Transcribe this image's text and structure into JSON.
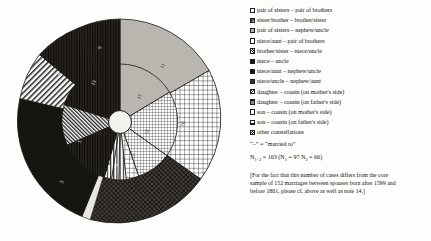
{
  "chart_data": {
    "type": "pie",
    "title": "",
    "subtitle": "",
    "xlabel": "",
    "ylabel": "",
    "legend_position": "right",
    "grid": false,
    "rings": 2,
    "center_hub": true,
    "categories": [
      "pair of sisters – pair of brothers",
      "sister/brother – brother/sister",
      "pair of sisters – nephew/uncle",
      "niece/aunt – pair of brothers",
      "brother/sister – niece/uncle",
      "niece – uncle",
      "niece/aunt – nephew/uncle",
      "niece/uncle – nephew/aunt",
      "daughter – cousin (on mother's side)",
      "daughter – cousin (on father's side)",
      "son – cousin (on mother's side)",
      "son – cousin (on father's side)",
      "other constellations"
    ],
    "outer_ring": {
      "name": "outer sectors",
      "segments": [
        {
          "label": "11",
          "value": 11,
          "pattern": "gray"
        },
        {
          "label": "16",
          "value": 16,
          "pattern": "grid-coarse"
        },
        {
          "label": "14",
          "value": 14,
          "pattern": "crosshatch-dark"
        },
        {
          "label": "5",
          "value": 5,
          "pattern": "black"
        },
        {
          "label": "7",
          "value": 7,
          "pattern": "diag-right"
        },
        {
          "label": "8",
          "value": 8,
          "pattern": "dense-dark"
        },
        {
          "label": "9",
          "value": 9,
          "pattern": "dense-dark"
        }
      ]
    },
    "inner_ring": {
      "name": "inner sectors",
      "segments": [
        {
          "label": "13",
          "value": 13,
          "pattern": "gray"
        },
        {
          "label": "12",
          "value": 12,
          "pattern": "grid-fine"
        },
        {
          "label": "10",
          "value": 10,
          "pattern": "grid-fine"
        },
        {
          "label": "6",
          "value": 6,
          "pattern": "grid-coarse"
        },
        {
          "label": "4",
          "value": 4,
          "pattern": "vert"
        },
        {
          "label": "3",
          "value": 3,
          "pattern": "vert"
        },
        {
          "label": "2",
          "value": 2,
          "pattern": "vert"
        },
        {
          "label": "1",
          "value": 1,
          "pattern": "diag-left-dense"
        },
        {
          "label": "15",
          "value": 15,
          "pattern": "dense-dark"
        }
      ]
    }
  },
  "legend": {
    "items": [
      {
        "pattern": "light-dots",
        "label": "pair of sisters – pair of brothers"
      },
      {
        "pattern": "grid-fine",
        "label": "sister/brother – brother/sister"
      },
      {
        "pattern": "gray",
        "label": "pair of sisters – nephew/uncle"
      },
      {
        "pattern": "grid-coarse",
        "label": "niece/aunt – pair of brothers"
      },
      {
        "pattern": "diag-right",
        "label": "brother/sister – niece/uncle"
      },
      {
        "pattern": "black",
        "label": "niece – uncle"
      },
      {
        "pattern": "dense-dark",
        "label": "niece/aunt – nephew/uncle"
      },
      {
        "pattern": "crosshatch-dark",
        "label": "niece/uncle – nephew/aunt"
      },
      {
        "pattern": "diag-left",
        "label": "daughter – cousin (on mother's side)"
      },
      {
        "pattern": "check",
        "label": "daughter – cousin (on father's side)"
      },
      {
        "pattern": "vert",
        "label": "son – cousin (on mother's side)"
      },
      {
        "pattern": "horiz",
        "label": "son – cousin (on father's side)"
      },
      {
        "pattern": "diag-left-dense",
        "label": "other constellations"
      }
    ]
  },
  "notes": {
    "married_key": "“–” = “married to”",
    "n_total_label": "N",
    "n_total_sub": "1+2",
    "n_total_value": "163",
    "n1_label": "N",
    "n1_sub": "1",
    "n1_value": "97",
    "n2_label": "N",
    "n2_sub": "2",
    "n2_value": "66",
    "footnote": "[For the fact that this number of cases differs from the core sample of 152 marriages between spouses born after 1599 and before 1801, please cf. above as well as note 14.]"
  }
}
